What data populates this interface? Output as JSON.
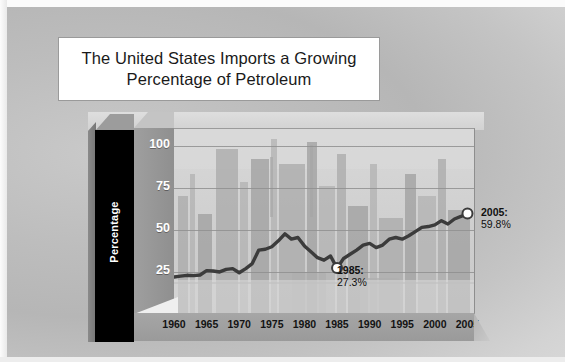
{
  "slide": {
    "title": "The United States Imports a Growing\nPercentage of Petroleum",
    "background_color": "#c0c0c0",
    "title_box_color": "#ffffff"
  },
  "chart_data": {
    "type": "line",
    "title": "The United States Imports a Growing Percentage of Petroleum",
    "xlabel": "",
    "ylabel": "Percentage",
    "ylim": [
      0,
      110
    ],
    "xlim": [
      1960,
      2006
    ],
    "grid": true,
    "legend": false,
    "ytick_labels": [
      "0",
      "25",
      "50",
      "75",
      "100"
    ],
    "ytick_values": [
      0,
      25,
      50,
      75,
      100
    ],
    "xtick_labels": [
      "1960",
      "1965",
      "1970",
      "1975",
      "1980",
      "1985",
      "1990",
      "1995",
      "2000",
      "2005"
    ],
    "xtick_values": [
      1960,
      1965,
      1970,
      1975,
      1980,
      1985,
      1990,
      1995,
      2000,
      2005
    ],
    "line_color": "#3b3b3b",
    "marker_fill": "#ffffff",
    "x": [
      1960,
      1961,
      1962,
      1963,
      1964,
      1965,
      1966,
      1967,
      1968,
      1969,
      1970,
      1971,
      1972,
      1973,
      1974,
      1975,
      1976,
      1977,
      1978,
      1979,
      1980,
      1981,
      1982,
      1983,
      1984,
      1985,
      1986,
      1987,
      1988,
      1989,
      1990,
      1991,
      1992,
      1993,
      1994,
      1995,
      1996,
      1997,
      1998,
      1999,
      2000,
      2001,
      2002,
      2003,
      2004,
      2005
    ],
    "y": [
      22.0,
      22.5,
      23.0,
      22.8,
      23.2,
      25.8,
      25.6,
      25.0,
      26.5,
      27.0,
      24.5,
      27.0,
      30.0,
      38.0,
      38.5,
      40.0,
      43.5,
      47.7,
      44.5,
      45.5,
      40.5,
      37.0,
      33.5,
      32.0,
      34.5,
      27.3,
      33.0,
      35.5,
      38.0,
      41.0,
      42.0,
      39.5,
      41.0,
      44.5,
      45.5,
      44.5,
      46.5,
      49.0,
      51.5,
      52.0,
      53.0,
      55.5,
      53.5,
      56.5,
      58.0,
      59.8
    ],
    "annotations": [
      {
        "name": "1985-callout",
        "year_label": "1985:",
        "value_label": "27.3%",
        "x": 1985,
        "y": 27.3
      },
      {
        "name": "2005-callout",
        "year_label": "2005:",
        "value_label": "59.8%",
        "x": 2005,
        "y": 59.8
      }
    ]
  }
}
